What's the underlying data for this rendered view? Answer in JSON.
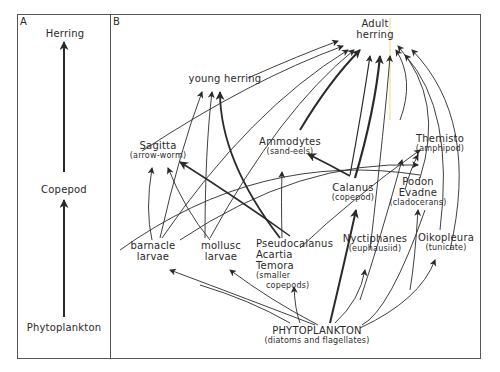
{
  "panel_a": {
    "letter": "A",
    "nodes": {
      "herring": "Herring",
      "copepod": "Copepod",
      "phytoplankton": "Phytoplankton"
    }
  },
  "panel_b": {
    "letter": "B",
    "nodes": {
      "adult_herring_1": "Adult",
      "adult_herring_2": "herring",
      "young_herring": "young herring",
      "sagitta": "Sagitta",
      "sagitta_sub": "(arrow-worm)",
      "ammodytes": "Ammodytes",
      "ammodytes_sub": "(sand-eels)",
      "themisto": "Themisto",
      "themisto_sub": "(amphipod)",
      "podon": "Podon",
      "evadne": "Evadne",
      "cladocerans_sub": "(cladocerans)",
      "calanus": "Calanus",
      "calanus_sub": "(copepod)",
      "barnacle_1": "barnacle",
      "barnacle_2": "larvae",
      "mollusc_1": "mollusc",
      "mollusc_2": "larvae",
      "pseudocalanus": "Pseudocalanus",
      "acartia": "Acartia",
      "temora": "Temora",
      "smaller_sub_1": "(smaller",
      "smaller_sub_2": "copepods)",
      "nyctiphanes": "Nyctiphanes",
      "nyctiphanes_sub": "(euphausiid)",
      "oikopleura": "Oikopleura",
      "oikopleura_sub": "(tunicate)",
      "phytoplankton": "PHYTOPLANKTON",
      "phytoplankton_sub": "(diatoms and flagellates)"
    }
  },
  "colors": {
    "line": "#2a2a2a",
    "border": "#555555",
    "highlight_line": "#f3e7a8"
  }
}
